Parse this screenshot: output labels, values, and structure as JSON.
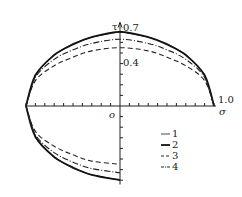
{
  "chart_data": {
    "type": "line",
    "title": "",
    "xlabel": "σ",
    "ylabel": "τ",
    "origin_label": "o",
    "xlim": [
      -1.0,
      1.0
    ],
    "ylim": [
      -0.7,
      0.7
    ],
    "x_tick_labels": [
      "1.0"
    ],
    "y_tick_labels": [
      "0.7",
      "0.4"
    ],
    "x_tick_step": 0.1,
    "y_tick_step": 0.1,
    "grid": false,
    "legend_position": "lower-right",
    "series": [
      {
        "name": "1",
        "style": "solid-thin",
        "x": [
          -1.0,
          -0.9,
          -0.7,
          -0.5,
          -0.3,
          0.0,
          0.3,
          0.5,
          0.7,
          0.9,
          1.0
        ],
        "y_upper": [
          0.0,
          0.3,
          0.49,
          0.59,
          0.65,
          0.7,
          0.65,
          0.59,
          0.49,
          0.3,
          0.0
        ]
      },
      {
        "name": "2",
        "style": "solid-thick",
        "x": [
          -1.0,
          -0.9,
          -0.7,
          -0.5,
          -0.3,
          0.0,
          0.3,
          0.5,
          0.7,
          0.9,
          1.0
        ],
        "y_upper": [
          0.0,
          0.29,
          0.48,
          0.58,
          0.65,
          0.7,
          0.65,
          0.58,
          0.48,
          0.29,
          0.0
        ]
      },
      {
        "name": "3",
        "style": "dashed",
        "x": [
          -1.0,
          -0.9,
          -0.7,
          -0.5,
          -0.3,
          0.0,
          0.3,
          0.5,
          0.7,
          0.9,
          1.0
        ],
        "y_upper": [
          0.0,
          0.24,
          0.38,
          0.46,
          0.52,
          0.55,
          0.52,
          0.46,
          0.38,
          0.24,
          0.0
        ]
      },
      {
        "name": "4",
        "style": "dash-dot",
        "x": [
          -1.0,
          -0.9,
          -0.7,
          -0.5,
          -0.3,
          0.0,
          0.3,
          0.5,
          0.7,
          0.9,
          1.0
        ],
        "y_upper": [
          0.0,
          0.27,
          0.44,
          0.53,
          0.59,
          0.63,
          0.59,
          0.53,
          0.44,
          0.27,
          0.0
        ]
      }
    ],
    "symmetry": "curves mirrored about σ-axis (τ negative below)"
  },
  "labels": {
    "tau": "τ",
    "sigma": "σ",
    "origin": "o",
    "y_07": "0.7",
    "y_04": "0.4",
    "x_10": "1.0"
  },
  "legend": [
    {
      "key": "1",
      "label": "1"
    },
    {
      "key": "2",
      "label": "2"
    },
    {
      "key": "3",
      "label": "3"
    },
    {
      "key": "4",
      "label": "4"
    }
  ]
}
